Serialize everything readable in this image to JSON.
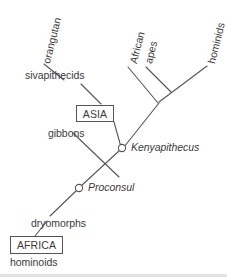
{
  "figure": {
    "type": "cladogram",
    "title": "",
    "line_color": "#555555",
    "text_color": "#3b3b3b",
    "node_fill": "#ffffff",
    "background": "#ffffff"
  },
  "nodes": [
    {
      "id": "proconsul",
      "label": "Proconsul",
      "style": "italic",
      "marker": "open-circle",
      "x": 79,
      "y": 188,
      "label_x": 88,
      "label_y": 182
    },
    {
      "id": "kenyapithecus",
      "label": "Kenyapithecus",
      "style": "italic",
      "marker": "open-circle",
      "x": 122,
      "y": 148,
      "label_x": 131,
      "label_y": 142
    }
  ],
  "tip_labels": [
    {
      "id": "orangutan",
      "label": "orangutan",
      "rotation": -76,
      "x": 41,
      "y": 62
    },
    {
      "id": "african",
      "label": "African",
      "rotation": -76,
      "x": 128,
      "y": 62
    },
    {
      "id": "apes",
      "label": "apes",
      "rotation": -76,
      "x": 143,
      "y": 62
    },
    {
      "id": "hominids",
      "label": "hominids",
      "rotation": -76,
      "x": 206,
      "y": 62
    }
  ],
  "branch_labels": [
    {
      "id": "sivapithecids",
      "label": "sivapithecids",
      "x": 25,
      "y": 70
    },
    {
      "id": "gibbons",
      "label": "gibbons",
      "x": 48,
      "y": 128
    },
    {
      "id": "dryomorphs",
      "label": "dryomorphs",
      "x": 31,
      "y": 218
    },
    {
      "id": "hominoids",
      "label": "hominoids",
      "x": 10,
      "y": 257
    }
  ],
  "region_boxes": [
    {
      "id": "asia",
      "label": "ASIA",
      "x": 76,
      "y": 105,
      "width": 38,
      "height": 17
    },
    {
      "id": "africa",
      "label": "AFRICA",
      "x": 10,
      "y": 236,
      "width": 53,
      "height": 18
    }
  ],
  "branches": [
    {
      "id": "branch-orangutan",
      "from": [
        44,
        64
      ],
      "to": [
        64,
        80
      ]
    },
    {
      "id": "branch-sivapithecids-to-asia",
      "from": [
        81,
        84
      ],
      "to": [
        101,
        104
      ]
    },
    {
      "id": "branch-asia-to-kenyapithecus",
      "from": [
        114,
        122
      ],
      "to": [
        121,
        147
      ]
    },
    {
      "id": "branch-african-apes",
      "from": [
        128,
        67
      ],
      "to": [
        158,
        103
      ]
    },
    {
      "id": "branch-apes",
      "from": [
        146,
        67
      ],
      "to": [
        171,
        92
      ]
    },
    {
      "id": "branch-hominids",
      "from": [
        207,
        66
      ],
      "to": [
        159,
        102
      ]
    },
    {
      "id": "branch-clade-to-kenyapithecus",
      "from": [
        159,
        103
      ],
      "to": [
        124,
        147
      ]
    },
    {
      "id": "branch-gibbons",
      "from": [
        73,
        133
      ],
      "to": [
        119,
        177
      ]
    },
    {
      "id": "branch-kenyapithecus-to-proconsul",
      "from": [
        120,
        150
      ],
      "to": [
        81,
        186
      ]
    },
    {
      "id": "branch-proconsul-to-dryomorphs",
      "from": [
        77,
        190
      ],
      "to": [
        50,
        216
      ]
    },
    {
      "id": "branch-dryomorphs-to-africa",
      "from": [
        47,
        221
      ],
      "to": [
        35,
        236
      ]
    }
  ]
}
